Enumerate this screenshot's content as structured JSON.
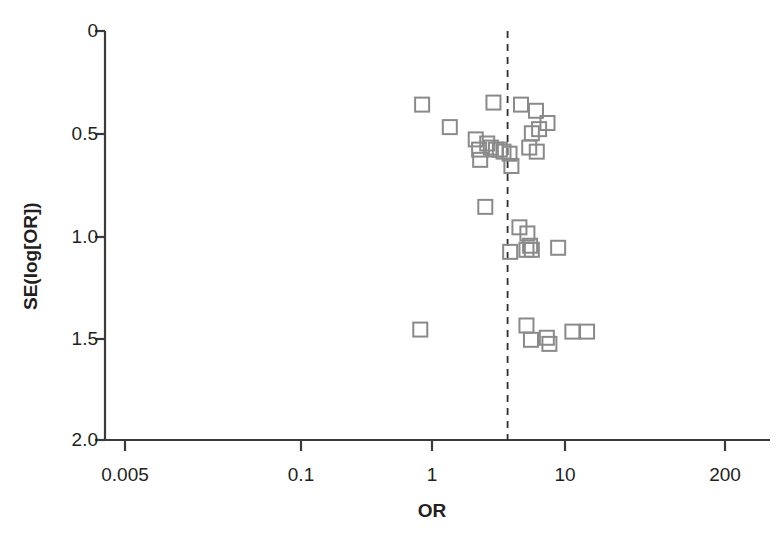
{
  "figure": {
    "kind": "funnel-plot",
    "background": "#ffffff",
    "marker_color": "#8a8a8a",
    "axis_color": "#3b3b3b",
    "text_color": "#231f20"
  },
  "axes": {
    "x_title": "OR",
    "y_title": "SE(log[OR])",
    "x_ticks": [
      "0.005",
      "0.1",
      "1",
      "10",
      "200"
    ],
    "y_ticks": [
      "0",
      "0.5",
      "1.0",
      "1.5",
      "2.0"
    ]
  },
  "reference_line": {
    "label": "pooled-effect-line",
    "style": "dashed",
    "or_value": 4.3
  },
  "chart_data": {
    "type": "scatter",
    "title": "",
    "subtitle": "",
    "xlabel": "OR",
    "ylabel": "SE(log[OR])",
    "xscale": "log",
    "xlim": [
      0.005,
      200
    ],
    "ylim": [
      0,
      2.0
    ],
    "y_inverted": true,
    "grid": false,
    "legend": "none",
    "xtick_values": [
      0.005,
      0.1,
      1,
      200
    ],
    "xtick_labels": [
      "0.005",
      "0.1",
      "1",
      "10",
      "200"
    ],
    "ytick_values": [
      0,
      0.5,
      1.0,
      1.5,
      2.0
    ],
    "ytick_labels": [
      "0",
      "0.5",
      "1.0",
      "1.5",
      "2.0"
    ],
    "annotations": [
      {
        "name": "reference-line",
        "type": "vline",
        "x": 4.3,
        "style": "dashed"
      }
    ],
    "marker": {
      "shape": "square",
      "filled": false,
      "size_px": 14,
      "edge_color": "#8a8a8a"
    },
    "series": [
      {
        "name": "studies",
        "points": [
          {
            "or": 0.95,
            "se": 0.36
          },
          {
            "or": 1.55,
            "se": 0.47
          },
          {
            "or": 3.35,
            "se": 0.35
          },
          {
            "or": 5.45,
            "se": 0.36
          },
          {
            "or": 7.1,
            "se": 0.39
          },
          {
            "or": 8.7,
            "se": 0.45
          },
          {
            "or": 2.45,
            "se": 0.53
          },
          {
            "or": 2.6,
            "se": 0.58
          },
          {
            "or": 3.0,
            "se": 0.55
          },
          {
            "or": 3.2,
            "se": 0.57
          },
          {
            "or": 3.5,
            "se": 0.58
          },
          {
            "or": 3.75,
            "se": 0.58
          },
          {
            "or": 4.0,
            "se": 0.59
          },
          {
            "or": 4.45,
            "se": 0.6
          },
          {
            "or": 2.65,
            "se": 0.63
          },
          {
            "or": 4.6,
            "se": 0.66
          },
          {
            "or": 6.6,
            "se": 0.5
          },
          {
            "or": 7.5,
            "se": 0.48
          },
          {
            "or": 6.3,
            "se": 0.57
          },
          {
            "or": 7.2,
            "se": 0.59
          },
          {
            "or": 2.9,
            "se": 0.86
          },
          {
            "or": 5.3,
            "se": 0.96
          },
          {
            "or": 6.1,
            "se": 0.99
          },
          {
            "or": 4.5,
            "se": 1.08
          },
          {
            "or": 6.0,
            "se": 1.07
          },
          {
            "or": 6.4,
            "se": 1.05
          },
          {
            "or": 6.6,
            "se": 1.07
          },
          {
            "or": 10.5,
            "se": 1.06
          },
          {
            "or": 0.92,
            "se": 1.46
          },
          {
            "or": 6.0,
            "se": 1.44
          },
          {
            "or": 6.5,
            "se": 1.51
          },
          {
            "or": 8.6,
            "se": 1.5
          },
          {
            "or": 9.0,
            "se": 1.53
          },
          {
            "or": 13.5,
            "se": 1.47
          },
          {
            "or": 17.5,
            "se": 1.47
          }
        ]
      }
    ]
  }
}
